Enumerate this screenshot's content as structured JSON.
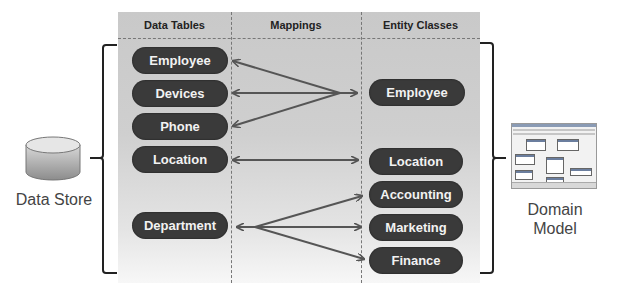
{
  "diagram": {
    "columns": [
      {
        "id": "data-tables",
        "header": "Data Tables"
      },
      {
        "id": "mappings",
        "header": "Mappings"
      },
      {
        "id": "entity-classes",
        "header": "Entity Classes"
      }
    ],
    "data_tables": [
      "Employee",
      "Devices",
      "Phone",
      "Location",
      "Department"
    ],
    "entity_classes": [
      "Employee",
      "Location",
      "Accounting",
      "Marketing",
      "Finance"
    ],
    "mappings": [
      {
        "from": "Employee",
        "to": "Employee"
      },
      {
        "from": "Devices",
        "to": "Employee"
      },
      {
        "from": "Phone",
        "to": "Employee"
      },
      {
        "from": "Location",
        "to": "Location"
      },
      {
        "from": "Department",
        "to": "Accounting"
      },
      {
        "from": "Department",
        "to": "Marketing"
      },
      {
        "from": "Department",
        "to": "Finance"
      }
    ],
    "left_label": "Data Store",
    "right_label_line1": "Domain",
    "right_label_line2": "Model",
    "colors": {
      "pill": "#3a3a3a",
      "pill_text": "#f2f2f2",
      "arrow": "#555555",
      "panel": "#c9c9c9",
      "bracket": "#222222"
    }
  }
}
